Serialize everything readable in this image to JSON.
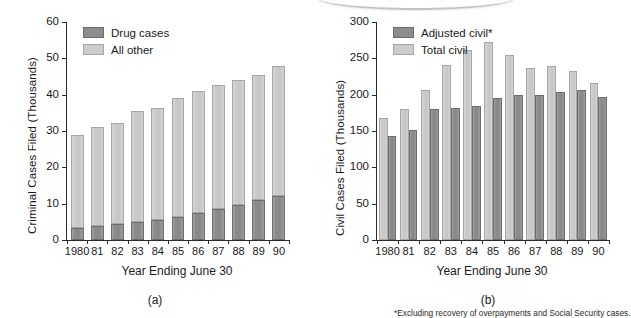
{
  "figure_a": {
    "panel_label": "(a)",
    "ylabel": "Criminal Cases Filed (Thousands)",
    "xlabel": "Year Ending June 30",
    "legend": [
      {
        "key": "drug",
        "label": "Drug cases",
        "color": "#8c8c8c"
      },
      {
        "key": "other",
        "label": "All other",
        "color": "#cccccc"
      }
    ],
    "chart_data": {
      "type": "bar",
      "subtype": "stacked",
      "title": "",
      "xlabel": "Year Ending June 30",
      "ylabel": "Criminal Cases Filed (Thousands)",
      "categories": [
        "1980",
        "81",
        "82",
        "83",
        "84",
        "85",
        "86",
        "87",
        "88",
        "89",
        "90"
      ],
      "ylim": [
        0,
        60
      ],
      "yticks": [
        0,
        10,
        20,
        30,
        40,
        50,
        60
      ],
      "grid": false,
      "legend_position": "top-left",
      "series": [
        {
          "name": "Drug cases",
          "color": "#8c8c8c",
          "values": [
            3.2,
            3.9,
            4.3,
            5.0,
            5.4,
            6.4,
            7.4,
            8.5,
            9.6,
            11.1,
            12.1
          ]
        },
        {
          "name": "All other",
          "color": "#cccccc",
          "values": [
            25.7,
            27.2,
            28.0,
            30.5,
            31.0,
            32.6,
            33.6,
            34.1,
            34.3,
            34.4,
            35.9
          ]
        }
      ],
      "totals": [
        28.9,
        31.1,
        32.3,
        35.5,
        36.4,
        39.0,
        41.0,
        42.6,
        43.9,
        45.5,
        48.0
      ]
    }
  },
  "figure_b": {
    "panel_label": "(b)",
    "ylabel": "Civil Cases Filed (Thousands)",
    "xlabel": "Year Ending June 30",
    "footnote": "*Excluding recovery of overpayments and Social Security cases.",
    "legend": [
      {
        "key": "adjusted",
        "label": "Adjusted civil*",
        "color": "#8c8c8c"
      },
      {
        "key": "total",
        "label": "Total civil",
        "color": "#cccccc"
      }
    ],
    "chart_data": {
      "type": "bar",
      "subtype": "grouped",
      "title": "",
      "xlabel": "Year Ending June 30",
      "ylabel": "Civil Cases Filed (Thousands)",
      "categories": [
        "1980",
        "81",
        "82",
        "83",
        "84",
        "85",
        "86",
        "87",
        "88",
        "89",
        "90"
      ],
      "ylim": [
        0,
        300
      ],
      "yticks": [
        0,
        50,
        100,
        150,
        200,
        250,
        300
      ],
      "grid": false,
      "legend_position": "top-left",
      "annotation": "*Excluding recovery of overpayments and Social Security cases.",
      "series": [
        {
          "name": "Total civil",
          "color": "#cccccc",
          "values": [
            168,
            180,
            206,
            241,
            261,
            273,
            255,
            237,
            239,
            232,
            216
          ]
        },
        {
          "name": "Adjusted civil*",
          "color": "#8c8c8c",
          "values": [
            143,
            152,
            180,
            181,
            185,
            196,
            199,
            200,
            204,
            206,
            197
          ]
        }
      ]
    }
  }
}
